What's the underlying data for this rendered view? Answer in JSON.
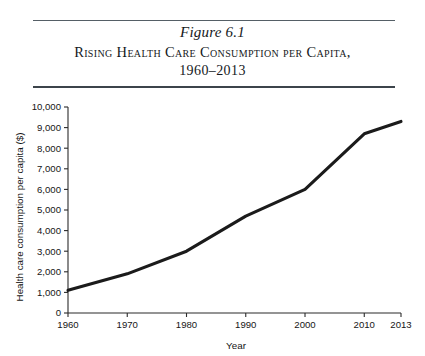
{
  "figure": {
    "number": "Figure 6.1",
    "title": "Rising Health Care Consumption per Capita,",
    "subtitle": "1960–2013"
  },
  "chart_data": {
    "type": "line",
    "xlabel": "Year",
    "ylabel": "Health care consumption per capita ($)",
    "categories": [
      "1960",
      "1970",
      "1980",
      "1990",
      "2000",
      "2010",
      "2013"
    ],
    "values": [
      1100,
      1900,
      3000,
      4700,
      6000,
      8700,
      9300
    ],
    "series": [
      {
        "name": "Health care consumption per capita",
        "values": [
          1100,
          1900,
          3000,
          4700,
          6000,
          8700,
          9300
        ]
      }
    ],
    "ylim": [
      0,
      10000
    ],
    "ytick_values": [
      0,
      1000,
      2000,
      3000,
      4000,
      5000,
      6000,
      7000,
      8000,
      9000,
      10000
    ],
    "ytick_labels": [
      "0",
      "1,000",
      "2,000",
      "3,000",
      "4,000",
      "5,000",
      "6,000",
      "7,000",
      "8,000",
      "9,000",
      "10,000"
    ],
    "xtick_labels": [
      "1960",
      "1970",
      "1980",
      "1990",
      "2000",
      "2010",
      "2013"
    ],
    "grid": false,
    "legend": "none",
    "line_color": "#1b1b1b"
  }
}
